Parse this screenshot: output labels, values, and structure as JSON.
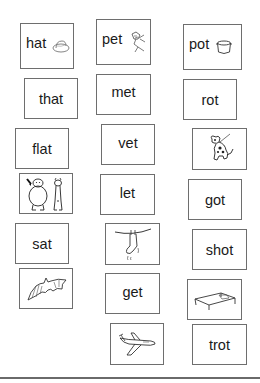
{
  "worksheet": {
    "cards": [
      {
        "id": "hat",
        "text": "hat",
        "icon": "hat-icon"
      },
      {
        "id": "pet",
        "text": "pet",
        "icon": "pet-dog-icon"
      },
      {
        "id": "pot",
        "text": "pot",
        "icon": "pot-icon"
      },
      {
        "id": "that",
        "text": "that"
      },
      {
        "id": "met",
        "text": "met"
      },
      {
        "id": "rot",
        "text": "rot"
      },
      {
        "id": "flat",
        "text": "flat"
      },
      {
        "id": "vet",
        "text": "vet"
      },
      {
        "id": "spotted-dog",
        "icon": "spotted-dog-icon"
      },
      {
        "id": "fat-thin",
        "icon": "fat-and-thin-figures-icon"
      },
      {
        "id": "let",
        "text": "let"
      },
      {
        "id": "got",
        "text": "got"
      },
      {
        "id": "sat",
        "text": "sat"
      },
      {
        "id": "wet-sock",
        "icon": "wet-sock-on-line-icon"
      },
      {
        "id": "shot",
        "text": "shot"
      },
      {
        "id": "bat",
        "icon": "bat-icon"
      },
      {
        "id": "get",
        "text": "get"
      },
      {
        "id": "cot",
        "icon": "cot-icon"
      },
      {
        "id": "jet",
        "icon": "jet-plane-icon"
      },
      {
        "id": "trot",
        "text": "trot"
      }
    ]
  },
  "colors": {
    "border": "#6e6e6e",
    "text": "#1a1a1a",
    "line": "#6a6a6a"
  }
}
